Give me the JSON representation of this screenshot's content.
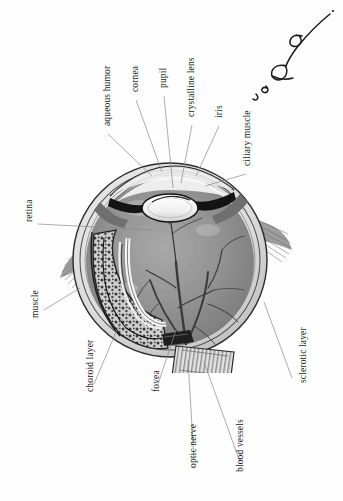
{
  "document": {
    "type": "anatomical-illustration",
    "subject": "human eye cross-section",
    "orientation": "rotated-90-ccw",
    "background_color": "#ffffff",
    "ink_color": "#1b1b1b",
    "leader_line_color": "#8a8a8a"
  },
  "labels": [
    {
      "id": "aqueous-humor",
      "text": "aqueous humor",
      "x": 103,
      "y": 126
    },
    {
      "id": "cornea",
      "text": "cornea",
      "x": 131,
      "y": 92
    },
    {
      "id": "pupil",
      "text": "pupil",
      "x": 159,
      "y": 88
    },
    {
      "id": "crystalline-lens",
      "text": "crystalline lens",
      "x": 187,
      "y": 117
    },
    {
      "id": "iris",
      "text": "iris",
      "x": 215,
      "y": 118
    },
    {
      "id": "ciliary-muscle",
      "text": "ciliary muscle",
      "x": 243,
      "y": 166
    },
    {
      "id": "retina",
      "text": "retina",
      "x": 25,
      "y": 222
    },
    {
      "id": "muscle",
      "text": "muscle",
      "x": 31,
      "y": 318
    },
    {
      "id": "choroid-layer",
      "text": "choroid layer",
      "x": 86,
      "y": 392
    },
    {
      "id": "fovea",
      "text": "fovea",
      "x": 152,
      "y": 392
    },
    {
      "id": "optic-nerve",
      "text": "optic nerve",
      "x": 189,
      "y": 468
    },
    {
      "id": "blood-vessels",
      "text": "blood vessels",
      "x": 236,
      "y": 472
    },
    {
      "id": "sclerotic-layer",
      "text": "sclerotic layer",
      "x": 299,
      "y": 383
    }
  ],
  "leader_lines": [
    {
      "id": "lead-aqueous-humor",
      "from": [
        108,
        134
      ],
      "to": [
        152,
        176
      ]
    },
    {
      "id": "lead-cornea",
      "from": [
        136,
        100
      ],
      "to": [
        160,
        172
      ]
    },
    {
      "id": "lead-pupil",
      "from": [
        164,
        96
      ],
      "to": [
        173,
        188
      ]
    },
    {
      "id": "lead-crystalline-lens",
      "from": [
        192,
        125
      ],
      "to": [
        180,
        183
      ]
    },
    {
      "id": "lead-iris",
      "from": [
        219,
        126
      ],
      "to": [
        195,
        176
      ]
    },
    {
      "id": "lead-ciliary-muscle",
      "from": [
        246,
        174
      ],
      "to": [
        203,
        184
      ]
    },
    {
      "id": "lead-retina",
      "from": [
        38,
        224
      ],
      "to": [
        150,
        229
      ]
    },
    {
      "id": "lead-muscle",
      "from": [
        44,
        310
      ],
      "to": [
        78,
        290
      ]
    },
    {
      "id": "lead-choroid-layer",
      "from": [
        94,
        384
      ],
      "to": [
        122,
        318
      ]
    },
    {
      "id": "lead-fovea",
      "from": [
        158,
        384
      ],
      "to": [
        176,
        330
      ]
    },
    {
      "id": "lead-optic-nerve",
      "from": [
        194,
        460
      ],
      "to": [
        188,
        362
      ]
    },
    {
      "id": "lead-blood-vessels",
      "from": [
        240,
        462
      ],
      "to": [
        204,
        364
      ]
    },
    {
      "id": "lead-sclerotic-layer",
      "from": [
        292,
        378
      ],
      "to": [
        262,
        300
      ]
    }
  ],
  "artwork": {
    "name": "eye-cross-section",
    "parts": [
      {
        "id": "sclera",
        "label": "sclerotic layer"
      },
      {
        "id": "choroid",
        "label": "choroid layer"
      },
      {
        "id": "retina",
        "label": "retina"
      },
      {
        "id": "vitreous-body",
        "label": "vitreous body"
      },
      {
        "id": "cornea",
        "label": "cornea"
      },
      {
        "id": "lens",
        "label": "crystalline lens"
      },
      {
        "id": "iris",
        "label": "iris"
      },
      {
        "id": "ciliary-muscle",
        "label": "ciliary muscle"
      },
      {
        "id": "optic-nerve",
        "label": "optic nerve"
      },
      {
        "id": "blood-vessels",
        "label": "blood vessels"
      },
      {
        "id": "extraocular-muscle-left",
        "label": "muscle"
      },
      {
        "id": "extraocular-muscle-right",
        "label": "muscle"
      }
    ]
  },
  "annotation": {
    "id": "handwritten-scribble",
    "description": "handwritten ink mark"
  }
}
